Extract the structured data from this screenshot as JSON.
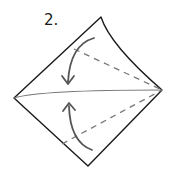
{
  "diagram": {
    "type": "origami-fold-instruction",
    "step_label": "2.",
    "colors": {
      "outline": "#1a1a1a",
      "crease": "#777777",
      "dashed_fold": "#777777",
      "arrow": "#555555",
      "background": "#ffffff"
    },
    "shape": {
      "kind": "square-rotated-as-kite",
      "corners": {
        "top": [
          101,
          17
        ],
        "right": [
          162,
          90
        ],
        "bottom": [
          88,
          166
        ],
        "left": [
          14,
          98
        ]
      }
    },
    "elements": [
      {
        "name": "center-crease",
        "kind": "solid-line",
        "from": "left",
        "to": "right"
      },
      {
        "name": "upper-valley-fold",
        "kind": "dashed-line",
        "from": "right",
        "to": [
          74,
          49
        ]
      },
      {
        "name": "lower-valley-fold",
        "kind": "dashed-line",
        "from": "right",
        "to": [
          62,
          144
        ]
      },
      {
        "name": "upper-fold-arrow",
        "kind": "curved-arrow",
        "direction": "down"
      },
      {
        "name": "lower-fold-arrow",
        "kind": "curved-arrow",
        "direction": "up"
      }
    ]
  }
}
